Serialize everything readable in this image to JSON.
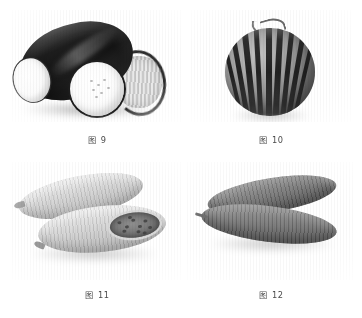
{
  "page": {
    "background_color": "#ffffff",
    "layout": "2x2 figure plate",
    "colorspace": "grayscale"
  },
  "figures": [
    {
      "id": "fig-9",
      "caption": "图 9",
      "subject": "winter-melon-cut",
      "description": "Dark winter melon with two pale cut cross-sections",
      "position": "top-left",
      "colors": {
        "rind": "#1d1d1d",
        "flesh": "#ffffff",
        "shadow": "#2a2a2a"
      }
    },
    {
      "id": "fig-10",
      "caption": "图 10",
      "subject": "striped-watermelon",
      "description": "Round striped melon with curled stem",
      "position": "top-right",
      "colors": {
        "rind": "#8d8d8d",
        "stripe": "#1c1c1c",
        "highlight": "#c2c2c2"
      }
    },
    {
      "id": "fig-11",
      "caption": "图 11",
      "subject": "pale-gourds",
      "description": "Two pale elongated gourds, the front one split open showing seed cavity",
      "position": "bottom-left",
      "colors": {
        "skin": "#cfcfcf",
        "cavity": "#7b7b7b",
        "seeds": "#3d3d3d"
      }
    },
    {
      "id": "fig-12",
      "caption": "图 12",
      "subject": "dark-cucumbers",
      "description": "Two darker elongated cucumbers arranged in a V shape",
      "position": "bottom-right",
      "colors": {
        "skin": "#767676",
        "shade": "#515151"
      }
    }
  ]
}
